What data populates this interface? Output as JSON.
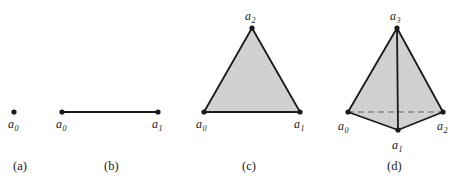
{
  "figure": {
    "background_color": "#ffffff",
    "stroke_color": "#1a1a1a",
    "fill_color": "#c9c9c9",
    "fill_color_dark": "#c2c2c2",
    "dashed_color": "#9a9a9a",
    "width": 458,
    "height": 194
  },
  "panels": [
    {
      "id": "panel-a",
      "caption": "(a)",
      "caption_x": 13,
      "caption_y": 160,
      "type": "point",
      "vertices": [
        {
          "label": "a",
          "sub": "0",
          "x": 14,
          "y": 112,
          "label_x": 8,
          "label_y": 118
        }
      ],
      "edges": [],
      "faces": []
    },
    {
      "id": "panel-b",
      "caption": "(b)",
      "caption_x": 104,
      "caption_y": 160,
      "type": "segment",
      "vertices": [
        {
          "label": "a",
          "sub": "0",
          "x": 62,
          "y": 112,
          "label_x": 56,
          "label_y": 118
        },
        {
          "label": "a",
          "sub": "1",
          "x": 158,
          "y": 112,
          "label_x": 152,
          "label_y": 118
        }
      ],
      "edges": [
        [
          0,
          1
        ]
      ],
      "faces": []
    },
    {
      "id": "panel-c",
      "caption": "(c)",
      "caption_x": 242,
      "caption_y": 160,
      "type": "triangle",
      "vertices": [
        {
          "label": "a",
          "sub": "0",
          "x": 204,
          "y": 112,
          "label_x": 196,
          "label_y": 118
        },
        {
          "label": "a",
          "sub": "1",
          "x": 300,
          "y": 112,
          "label_x": 294,
          "label_y": 118
        },
        {
          "label": "a",
          "sub": "2",
          "x": 252,
          "y": 28,
          "label_x": 245,
          "label_y": 10
        }
      ],
      "edges": [
        [
          0,
          1
        ],
        [
          1,
          2
        ],
        [
          2,
          0
        ]
      ],
      "faces": [
        [
          0,
          1,
          2
        ]
      ]
    },
    {
      "id": "panel-d",
      "caption": "(d)",
      "caption_x": 387,
      "caption_y": 160,
      "type": "tetrahedron",
      "vertices": [
        {
          "label": "a",
          "sub": "0",
          "x": 348,
          "y": 112,
          "label_x": 338,
          "label_y": 120
        },
        {
          "label": "a",
          "sub": "1",
          "x": 398,
          "y": 130,
          "label_x": 392,
          "label_y": 139
        },
        {
          "label": "a",
          "sub": "2",
          "x": 443,
          "y": 112,
          "label_x": 437,
          "label_y": 120
        },
        {
          "label": "a",
          "sub": "3",
          "x": 397,
          "y": 28,
          "label_x": 390,
          "label_y": 10
        }
      ],
      "edges": [
        [
          0,
          3
        ],
        [
          2,
          3
        ],
        [
          1,
          3
        ],
        [
          0,
          1
        ],
        [
          1,
          2
        ]
      ],
      "hidden_edges": [
        [
          0,
          2
        ]
      ],
      "faces": [
        [
          0,
          1,
          3
        ],
        [
          1,
          2,
          3
        ]
      ]
    }
  ],
  "chart_data": {
    "type": "diagram",
    "items": [
      {
        "caption": "(a)",
        "name": "0-simplex (point)",
        "vertex_labels": [
          "a0"
        ]
      },
      {
        "caption": "(b)",
        "name": "1-simplex (segment)",
        "vertex_labels": [
          "a0",
          "a1"
        ]
      },
      {
        "caption": "(c)",
        "name": "2-simplex (triangle)",
        "vertex_labels": [
          "a0",
          "a1",
          "a2"
        ]
      },
      {
        "caption": "(d)",
        "name": "3-simplex (tetrahedron)",
        "vertex_labels": [
          "a0",
          "a1",
          "a2",
          "a3"
        ]
      }
    ]
  }
}
